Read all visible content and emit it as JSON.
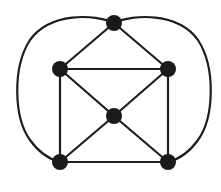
{
  "diagram": {
    "type": "graph",
    "colors": {
      "edge": "#1e1e1e",
      "node": "#1a1a1a",
      "background": "#ffffff"
    },
    "node_radius": 8,
    "nodes": [
      {
        "id": "top",
        "x": 114,
        "y": 23
      },
      {
        "id": "left",
        "x": 60,
        "y": 69
      },
      {
        "id": "right",
        "x": 168,
        "y": 69
      },
      {
        "id": "center",
        "x": 114,
        "y": 116
      },
      {
        "id": "bottom-left",
        "x": 60,
        "y": 162
      },
      {
        "id": "bottom-right",
        "x": 168,
        "y": 162
      }
    ],
    "edges": [
      {
        "from": "top",
        "to": "left",
        "shape": "straight"
      },
      {
        "from": "top",
        "to": "right",
        "shape": "straight"
      },
      {
        "from": "left",
        "to": "right",
        "shape": "straight"
      },
      {
        "from": "left",
        "to": "bottom-left",
        "shape": "straight"
      },
      {
        "from": "right",
        "to": "bottom-right",
        "shape": "straight"
      },
      {
        "from": "left",
        "to": "center",
        "shape": "straight"
      },
      {
        "from": "right",
        "to": "center",
        "shape": "straight"
      },
      {
        "from": "center",
        "to": "bottom-left",
        "shape": "straight"
      },
      {
        "from": "center",
        "to": "bottom-right",
        "shape": "straight"
      },
      {
        "from": "bottom-left",
        "to": "bottom-right",
        "shape": "straight"
      },
      {
        "from": "top",
        "to": "bottom-left",
        "shape": "curved-outer-left"
      },
      {
        "from": "top",
        "to": "bottom-right",
        "shape": "curved-outer-right"
      }
    ]
  }
}
